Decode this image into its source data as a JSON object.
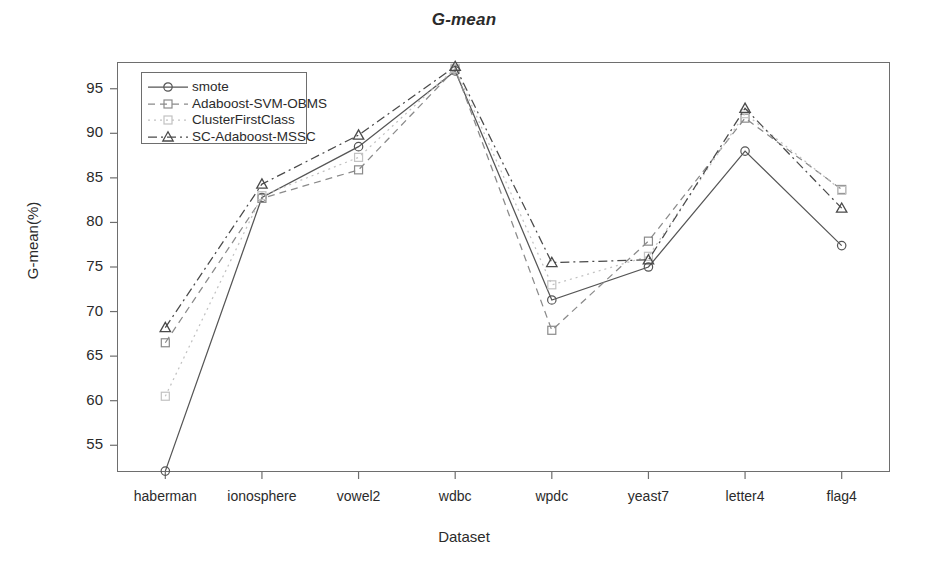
{
  "chart_data": {
    "type": "line",
    "title": "G-mean",
    "xlabel": "Dataset",
    "ylabel": "G-mean(%)",
    "categories": [
      "haberman",
      "ionosphere",
      "vowel2",
      "wdbc",
      "wpdc",
      "yeast7",
      "letter4",
      "flag4"
    ],
    "ylim": [
      52,
      98
    ],
    "yticks": [
      55,
      60,
      65,
      70,
      75,
      80,
      85,
      90,
      95
    ],
    "grid": false,
    "legend_position": "top-left inside",
    "series": [
      {
        "name": "smote",
        "marker": "circle",
        "linestyle": "solid",
        "color": "#555555",
        "values": [
          52.1,
          82.8,
          88.5,
          97.0,
          71.3,
          75.0,
          88.0,
          77.4
        ]
      },
      {
        "name": "Adaboost-SVM-OBMS",
        "marker": "square",
        "linestyle": "dashed",
        "color": "#8a8a8a",
        "values": [
          66.5,
          82.7,
          85.9,
          97.2,
          67.9,
          77.9,
          91.7,
          83.7
        ]
      },
      {
        "name": "ClusterFirstClass",
        "marker": "square",
        "linestyle": "dotted",
        "color": "#c2c2c2",
        "values": [
          60.5,
          83.0,
          87.3,
          97.3,
          73.0,
          76.2,
          92.2,
          83.6
        ]
      },
      {
        "name": "SC-Adaboost-MSSC",
        "marker": "triangle",
        "linestyle": "dashdot",
        "color": "#4a4a4a",
        "values": [
          68.2,
          84.3,
          89.8,
          97.5,
          75.5,
          75.8,
          92.8,
          81.6
        ]
      }
    ]
  }
}
